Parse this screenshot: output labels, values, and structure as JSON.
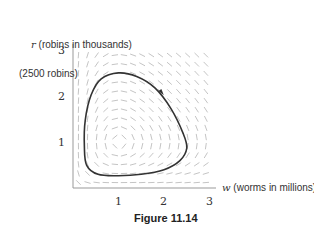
{
  "chart_data": {
    "type": "line",
    "subtype": "phase-plane with slope field",
    "title": "Figure 11.14",
    "xlabel": "w (worms in millions)",
    "ylabel": "r (robins in thousands)",
    "xlabel_var": "w",
    "xlabel_text": "(worms in millions)",
    "ylabel_var": "r",
    "ylabel_text": "(robins in thousands)",
    "annotation": "(2500 robins)",
    "annotation_y": 2.5,
    "xticks": [
      "1",
      "2",
      "3"
    ],
    "yticks": [
      "1",
      "2",
      "3"
    ],
    "xlim": [
      0,
      3
    ],
    "ylim": [
      0,
      3
    ],
    "grid": false,
    "slope_field": true,
    "equilibrium": [
      1,
      1
    ],
    "direction": "clockwise",
    "arrow_at": [
      1.95,
      2.1
    ],
    "series": [
      {
        "name": "trajectory",
        "closed": true,
        "points": [
          [
            1.0,
            2.53
          ],
          [
            1.4,
            2.45
          ],
          [
            1.8,
            2.2
          ],
          [
            2.15,
            1.75
          ],
          [
            2.42,
            1.2
          ],
          [
            2.5,
            0.88
          ],
          [
            2.35,
            0.6
          ],
          [
            2.0,
            0.4
          ],
          [
            1.5,
            0.3
          ],
          [
            1.0,
            0.27
          ],
          [
            0.55,
            0.3
          ],
          [
            0.3,
            0.5
          ],
          [
            0.25,
            0.9
          ],
          [
            0.27,
            1.5
          ],
          [
            0.4,
            2.05
          ],
          [
            0.62,
            2.4
          ],
          [
            1.0,
            2.53
          ]
        ]
      }
    ]
  },
  "figure": {
    "caption": "Figure 11.14",
    "y_axis_var": "r",
    "y_axis_text": " (robins in thousands)",
    "x_axis_var": "w",
    "x_axis_text": " (worms in millions)",
    "annotation": "(2500 robins)",
    "xticks": [
      "1",
      "2",
      "3"
    ],
    "yticks": [
      "1",
      "2",
      "3"
    ],
    "colors": {
      "curve": "#333333",
      "field": "#bdbdbd",
      "axis": "#999999",
      "text": "#333333"
    }
  }
}
